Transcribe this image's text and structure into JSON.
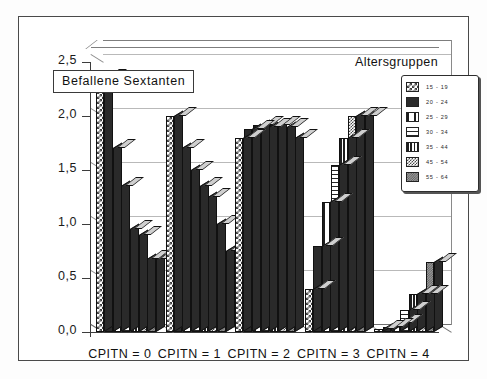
{
  "chart_data": {
    "type": "bar",
    "title": "Befallene Sextanten",
    "legend_title": "Altersgruppen",
    "legend_position": "top-right",
    "xlabel": "",
    "ylabel": "Befallene Sextanten",
    "grid": true,
    "ylim": [
      0.0,
      2.5
    ],
    "yticks": [
      "0,0",
      "0,5",
      "1,0",
      "1,5",
      "2,0",
      "2,5"
    ],
    "ytick_values": [
      0.0,
      0.5,
      1.0,
      1.5,
      2.0,
      2.5
    ],
    "categories": [
      "CPITN = 0",
      "CPITN = 1",
      "CPITN = 2",
      "CPITN = 3",
      "CPITN = 4"
    ],
    "series": [
      {
        "name": "15 - 19",
        "pattern": "checker",
        "values": [
          2.35,
          2.0,
          1.8,
          0.4,
          0.03
        ]
      },
      {
        "name": "20 - 24",
        "pattern": "solid",
        "values": [
          1.7,
          1.7,
          1.88,
          0.8,
          0.05
        ]
      },
      {
        "name": "25 - 29",
        "pattern": "vwide",
        "values": [
          1.35,
          1.5,
          1.92,
          1.2,
          0.08
        ]
      },
      {
        "name": "30 - 34",
        "pattern": "horiz",
        "values": [
          0.95,
          1.35,
          1.9,
          1.55,
          0.2
        ]
      },
      {
        "name": "35 - 44",
        "pattern": "vnarrow",
        "values": [
          0.9,
          1.25,
          1.92,
          1.8,
          0.35
        ]
      },
      {
        "name": "45 - 54",
        "pattern": "fine",
        "values": [
          0.68,
          1.0,
          1.9,
          2.0,
          0.35
        ]
      },
      {
        "name": "55 - 64",
        "pattern": "stipple",
        "values": [
          0.68,
          0.75,
          1.8,
          2.0,
          0.65
        ]
      }
    ]
  }
}
